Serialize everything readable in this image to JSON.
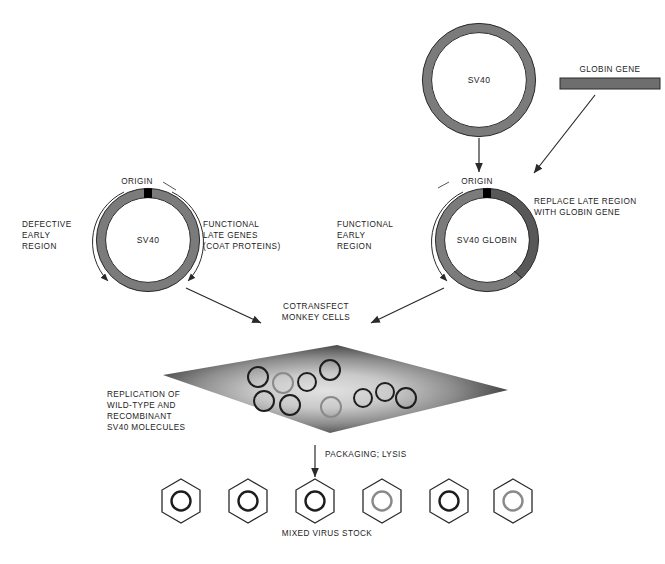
{
  "figure": {
    "type": "biology-process-diagram"
  },
  "top_plasmid": {
    "label": "SV40",
    "center_x": 479,
    "center_y": 80,
    "radius": 52
  },
  "globin_gene": {
    "label": "GLOBIN GENE",
    "x": 560,
    "y": 78,
    "width": 100,
    "height": 11,
    "color": "#6e6e6e"
  },
  "left_plasmid": {
    "name": "SV40",
    "origin_label": "ORIGIN",
    "left_label_lines": [
      "DEFECTIVE",
      "EARLY",
      "REGION"
    ],
    "right_label_lines": [
      "FUNCTIONAL",
      "LATE GENES",
      "(COAT PROTEINS)"
    ],
    "center_x": 148,
    "center_y": 240,
    "radius": 47
  },
  "right_plasmid": {
    "name": "SV40 GLOBIN",
    "origin_label": "ORIGIN",
    "left_label_lines": [
      "FUNCTIONAL",
      "EARLY",
      "REGION"
    ],
    "right_label_lines": [
      "REPLACE LATE REGION",
      "WITH GLOBIN GENE"
    ],
    "center_x": 487,
    "center_y": 240,
    "radius": 47
  },
  "cotransfect": {
    "lines": [
      "COTRANSFECT",
      "MONKEY CELLS"
    ]
  },
  "cell": {
    "replication_label_lines": [
      "REPLICATION OF",
      "WILD-TYPE AND",
      "RECOMBINANT",
      "SV40 MOLECULES"
    ],
    "molecules": [
      {
        "cx": 258,
        "cy": 377,
        "r": 10,
        "ring": "#1d1d1d"
      },
      {
        "cx": 283,
        "cy": 383,
        "r": 10,
        "ring": "#8a8a8a"
      },
      {
        "cx": 307,
        "cy": 382,
        "r": 9,
        "ring": "#1d1d1d"
      },
      {
        "cx": 290,
        "cy": 405,
        "r": 10,
        "ring": "#1d1d1d"
      },
      {
        "cx": 264,
        "cy": 401,
        "r": 10,
        "ring": "#1d1d1d"
      },
      {
        "cx": 330,
        "cy": 370,
        "r": 10,
        "ring": "#1d1d1d"
      },
      {
        "cx": 331,
        "cy": 407,
        "r": 10,
        "ring": "#8a8a8a"
      },
      {
        "cx": 363,
        "cy": 398,
        "r": 9,
        "ring": "#1d1d1d"
      },
      {
        "cx": 385,
        "cy": 392,
        "r": 9,
        "ring": "#1d1d1d"
      },
      {
        "cx": 406,
        "cy": 398,
        "r": 10,
        "ring": "#1d1d1d"
      }
    ]
  },
  "packaging": {
    "label": "PACKAGING; LYSIS"
  },
  "virus_stock": {
    "label": "MIXED VIRUS STOCK",
    "particles": [
      {
        "cx": 181,
        "cy": 501,
        "ring": "#1d1d1d",
        "kind": "wild-type"
      },
      {
        "cx": 248,
        "cy": 501,
        "ring": "#1d1d1d",
        "kind": "wild-type"
      },
      {
        "cx": 315,
        "cy": 501,
        "ring": "#1d1d1d",
        "kind": "wild-type"
      },
      {
        "cx": 382,
        "cy": 501,
        "ring": "#8a8a8a",
        "kind": "recombinant"
      },
      {
        "cx": 449,
        "cy": 501,
        "ring": "#1d1d1d",
        "kind": "wild-type"
      },
      {
        "cx": 513,
        "cy": 501,
        "ring": "#8a8a8a",
        "kind": "recombinant"
      }
    ]
  },
  "colors": {
    "ring_gray": "#7b7b7b",
    "ring_dark_gray": "#5c5c5c",
    "outline": "#2a2a2a",
    "origin_black": "#000000",
    "text": "#1c1c1c",
    "cell_dark": "#2b2b2b",
    "cell_light": "#d9d9d9"
  }
}
